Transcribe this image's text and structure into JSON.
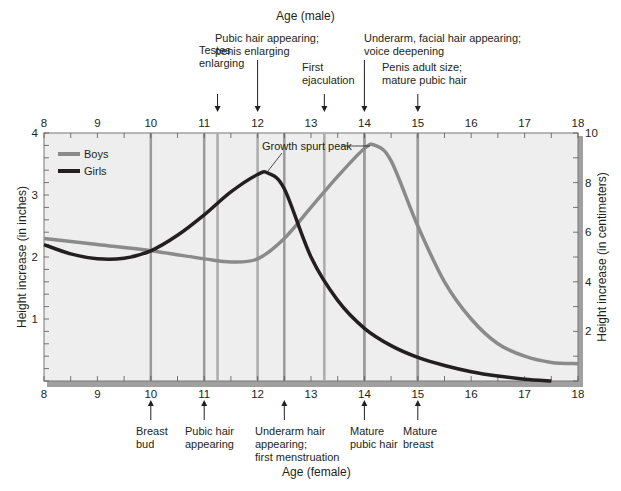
{
  "chart_data": {
    "type": "line",
    "title": "",
    "top_axis_title": "Age (male)",
    "bottom_axis_title": "Age (female)",
    "ylabel_left": "Height increase (in inches)",
    "ylabel_right": "Height increase (in centimeters)",
    "xlim": [
      8,
      18
    ],
    "ylim_inches": [
      0,
      4
    ],
    "ylim_cm": [
      0,
      10
    ],
    "x_ticks": [
      8,
      9,
      10,
      11,
      12,
      13,
      14,
      15,
      16,
      17,
      18
    ],
    "y_ticks_left": [
      1,
      2,
      3,
      4
    ],
    "y_ticks_right": [
      2,
      4,
      6,
      8,
      10
    ],
    "grid": false,
    "legend": {
      "position": "upper-left",
      "entries": [
        "Boys",
        "Girls"
      ]
    },
    "series": [
      {
        "name": "Boys",
        "color": "#8a8a8a",
        "x": [
          8,
          9,
          10,
          11,
          11.5,
          12,
          12.5,
          13,
          13.5,
          14,
          14.2,
          14.5,
          15,
          15.5,
          16,
          16.5,
          17,
          17.5,
          18
        ],
        "values": [
          2.3,
          2.2,
          2.1,
          1.97,
          1.92,
          1.97,
          2.3,
          2.8,
          3.3,
          3.75,
          3.8,
          3.55,
          2.5,
          1.6,
          1.0,
          0.6,
          0.4,
          0.3,
          0.28
        ]
      },
      {
        "name": "Girls",
        "color": "#231f20",
        "x": [
          8,
          8.5,
          9,
          9.5,
          10,
          10.5,
          11,
          11.5,
          12,
          12.2,
          12.5,
          13,
          13.5,
          14,
          14.5,
          15,
          15.5,
          16,
          16.5,
          17,
          17.5
        ],
        "values": [
          2.2,
          2.05,
          1.97,
          1.98,
          2.1,
          2.35,
          2.68,
          3.05,
          3.33,
          3.35,
          3.1,
          2.0,
          1.3,
          0.85,
          0.57,
          0.38,
          0.25,
          0.15,
          0.08,
          0.03,
          0.0
        ]
      }
    ],
    "annotations": [
      {
        "text": "Growth spurt peak",
        "points_to": [
          "Girls peak ~12.2",
          "Boys peak ~14.2"
        ]
      }
    ],
    "male_milestones": [
      {
        "age": 11.25,
        "lines": [
          "Testes",
          "enlarging"
        ]
      },
      {
        "age": 12.0,
        "lines": [
          "Pubic hair appearing;",
          "penis enlarging"
        ]
      },
      {
        "age": 13.25,
        "lines": [
          "First",
          "ejaculation"
        ]
      },
      {
        "age": 14.0,
        "lines": [
          "Underarm, facial hair appearing;",
          "voice deepening"
        ]
      },
      {
        "age": 15.0,
        "lines": [
          "Penis adult size;",
          "mature pubic hair"
        ]
      }
    ],
    "female_milestones": [
      {
        "age": 10.0,
        "lines": [
          "Breast",
          "bud"
        ]
      },
      {
        "age": 11.0,
        "lines": [
          "Pubic hair",
          "appearing"
        ]
      },
      {
        "age": 12.5,
        "lines": [
          "Underarm hair",
          "appearing;",
          "first menstruation"
        ]
      },
      {
        "age": 14.0,
        "lines": [
          "Mature",
          "pubic hair"
        ]
      },
      {
        "age": 15.0,
        "lines": [
          "Mature",
          "breast"
        ]
      }
    ]
  },
  "colors": {
    "plot_bg": "#eeeeee",
    "frame": "#6d6d6d",
    "shadow": "#9a9a9a",
    "milestone_line": "#a8a8a8",
    "boys": "#8a8a8a",
    "girls": "#231f20"
  }
}
